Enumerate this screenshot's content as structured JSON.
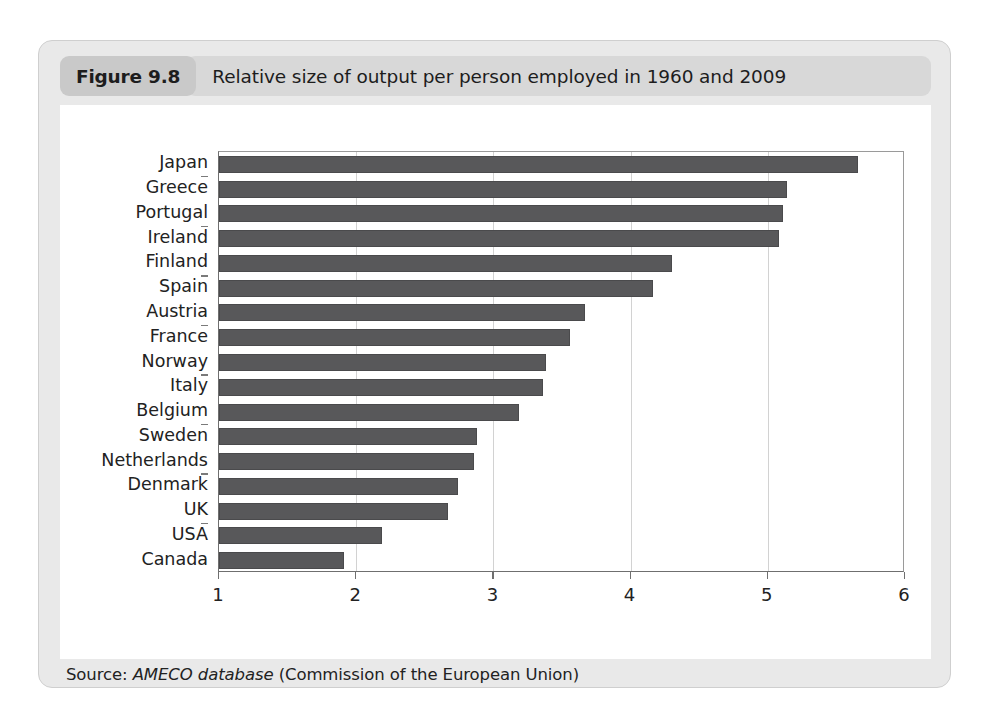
{
  "figure": {
    "number_label": "Figure 9.8",
    "title": "Relative size of output per person employed in 1960 and 2009",
    "source_prefix": "Source: ",
    "source_emphasis": "AMECO database",
    "source_suffix": " (Commission of the European Union)"
  },
  "colors": {
    "bar": "#58585a",
    "card_background": "#e9e9e9",
    "badge": "#c9c9c9",
    "title_bar": "#d8d8d8",
    "panel": "#ffffff",
    "gridline": "#d2d2d2",
    "axis": "#6f6f6f"
  },
  "chart_data": {
    "type": "bar",
    "orientation": "horizontal",
    "title": "Relative size of output per person employed in 1960 and 2009",
    "xlabel": "",
    "ylabel": "",
    "xlim": [
      1,
      6
    ],
    "ylim": null,
    "grid": "vertical",
    "legend": "none",
    "xticks": [
      "1",
      "2",
      "3",
      "4",
      "5",
      "6"
    ],
    "xtick_values": [
      1,
      2,
      3,
      4,
      5,
      6
    ],
    "categories": [
      "Japan",
      "Greece",
      "Portugal",
      "Ireland",
      "Finland",
      "Spain",
      "Austria",
      "France",
      "Norway",
      "Italy",
      "Belgium",
      "Sweden",
      "Netherlands",
      "Denmark",
      "UK",
      "USA",
      "Canada"
    ],
    "values": [
      5.66,
      5.14,
      5.11,
      5.08,
      4.3,
      4.16,
      3.67,
      3.56,
      3.38,
      3.36,
      3.19,
      2.88,
      2.86,
      2.74,
      2.67,
      2.19,
      1.91
    ]
  }
}
